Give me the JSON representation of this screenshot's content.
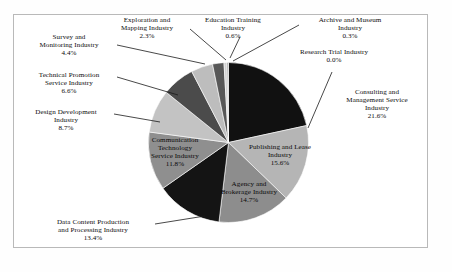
{
  "figure": {
    "frame_border_color": "#b9b9b9",
    "background": "#ffffff"
  },
  "chart_data": {
    "type": "pie",
    "title": "",
    "xlabel": "",
    "ylabel": "",
    "legend_position": "none",
    "grid": false,
    "units": "percent",
    "start_angle_deg": 0,
    "direction": "clockwise",
    "categories": [
      "Consulting and Management Service Industry",
      "Publishing and Lease Industry",
      "Agency and Brokerage Industry",
      "Data Content Production and Processing Industry",
      "Communication Technology Service Industry",
      "Design Development Industry",
      "Technical Promotion Service Industry",
      "Survey and Monitoring Industry",
      "Exploration and Mapping Industry",
      "Education Training Industry",
      "Archive and Museum Industry",
      "Research Trial Industry"
    ],
    "values": [
      21.6,
      15.6,
      14.7,
      13.4,
      11.8,
      8.7,
      6.6,
      4.4,
      2.3,
      0.6,
      0.3,
      0.0
    ],
    "colors": [
      "#111111",
      "#b5b5b5",
      "#8d8d8d",
      "#141414",
      "#8f8f8f",
      "#c3c3c3",
      "#4b4b4b",
      "#bdbdbd",
      "#585858",
      "#d2d2d2",
      "#9a9a9a",
      "#6e6e6e"
    ],
    "slices": [
      {
        "label": "Consulting and Management Service Industry",
        "value": 21.6,
        "color": "#111111",
        "label_placement": "outside-right"
      },
      {
        "label": "Publishing and Lease Industry",
        "value": 15.6,
        "color": "#b5b5b5",
        "label_placement": "inside"
      },
      {
        "label": "Agency and Brokerage Industry",
        "value": 14.7,
        "color": "#8d8d8d",
        "label_placement": "inside"
      },
      {
        "label": "Data Content Production and Processing Industry",
        "value": 13.4,
        "color": "#141414",
        "label_placement": "outside-left"
      },
      {
        "label": "Communication Technology Service Industry",
        "value": 11.8,
        "color": "#8f8f8f",
        "label_placement": "inside"
      },
      {
        "label": "Design Development Industry",
        "value": 8.7,
        "color": "#c3c3c3",
        "label_placement": "outside-left"
      },
      {
        "label": "Technical Promotion Service Industry",
        "value": 6.6,
        "color": "#4b4b4b",
        "label_placement": "outside-left"
      },
      {
        "label": "Survey and Monitoring Industry",
        "value": 4.4,
        "color": "#bdbdbd",
        "label_placement": "outside-left"
      },
      {
        "label": "Exploration and Mapping Industry",
        "value": 2.3,
        "color": "#585858",
        "label_placement": "outside-top"
      },
      {
        "label": "Education Training Industry",
        "value": 0.6,
        "color": "#d2d2d2",
        "label_placement": "outside-top"
      },
      {
        "label": "Archive and Museum Industry",
        "value": 0.3,
        "color": "#9a9a9a",
        "label_placement": "outside-right"
      },
      {
        "label": "Research Trial Industry",
        "value": 0.0,
        "color": "#6e6e6e",
        "label_placement": "outside-right"
      }
    ]
  },
  "labels": {
    "exploration_mapping": {
      "l1": "Exploration and",
      "l2": "Mapping Industry",
      "pct": "2.3%"
    },
    "education_training": {
      "l1": "Education Training",
      "l2": "Industry",
      "pct": "0.6%"
    },
    "archive_museum": {
      "l1": "Archive and Museum",
      "l2": "Industry",
      "pct": "0.3%"
    },
    "research_trial": {
      "l1": "Research Trial Industry",
      "l2": "",
      "pct": "0.0%"
    },
    "survey_monitoring": {
      "l1": "Survey and",
      "l2": "Monitoring Industry",
      "pct": "4.4%"
    },
    "technical_promotion": {
      "l1": "Technical Promotion",
      "l2": "Service Industry",
      "pct": "6.6%"
    },
    "design_development": {
      "l1": "Design Development",
      "l2": "Industry",
      "pct": "8.7%"
    },
    "consulting_mgmt": {
      "l1": "Consulting and",
      "l2": "Management Service",
      "l3": "Industry",
      "pct": "21.6%"
    },
    "publishing_lease": {
      "l1": "Publishing and Lease",
      "l2": "Industry",
      "pct": "15.6%"
    },
    "agency_brokerage": {
      "l1": "Agency and",
      "l2": "Brokerage Industry",
      "pct": "14.7%"
    },
    "communication_tech": {
      "l1": "Communication",
      "l2": "Technology",
      "l3": "Service Industry",
      "pct": "11.8%"
    },
    "data_content": {
      "l1": "Data Content Production",
      "l2": "and Processing Industry",
      "pct": "13.4%"
    }
  }
}
